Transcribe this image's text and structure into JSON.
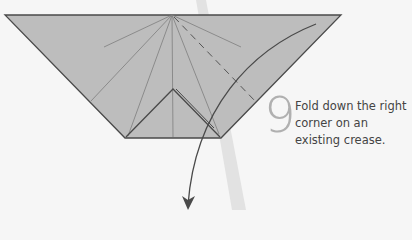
{
  "instruction": {
    "step_number": "9",
    "text": "Fold down the right corner on an existing crease."
  },
  "colors": {
    "paper": "#bdbdbd",
    "outline": "#4a4a4a",
    "crease": "#8a8a8a",
    "background": "#f6f6f6",
    "shadow_line": "#e0e0e0",
    "step_number": "#b0b0b0"
  }
}
